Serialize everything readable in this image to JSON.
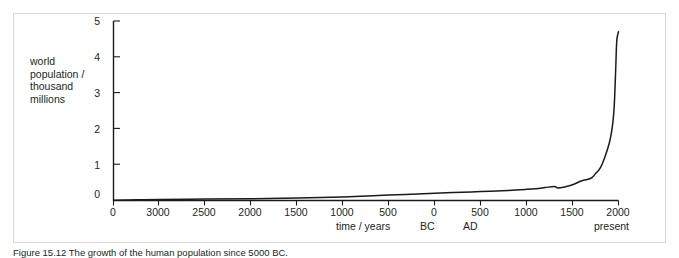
{
  "figure": {
    "caption": "Figure 15.12  The growth of the human population since 5000 BC.",
    "frame_color": "#d9d9d9",
    "line_color": "#1a1a1a",
    "background": "#ffffff"
  },
  "chart_data": {
    "type": "line",
    "title": "",
    "xlabel": "time / years",
    "ylabel": "world population / thousand millions",
    "ylabel_lines": [
      "world",
      "population /",
      "thousand",
      "millions"
    ],
    "grid": false,
    "legend": "none",
    "ylim": [
      0,
      5
    ],
    "ytick_labels": [
      "5",
      "4",
      "3",
      "2",
      "1",
      "0"
    ],
    "ytick_values": [
      5,
      4,
      3,
      2,
      1,
      0
    ],
    "xtick_labels": [
      "0",
      "3000",
      "2500",
      "2000",
      "1500",
      "1000",
      "500",
      "0",
      "500",
      "1000",
      "1500",
      "2000"
    ],
    "xtick_years": [
      -5000,
      -3000,
      -2500,
      -2000,
      -1500,
      -1000,
      -500,
      0,
      500,
      1000,
      1500,
      2000
    ],
    "era_annotations": [
      {
        "label": "time / years"
      },
      {
        "label": "BC"
      },
      {
        "label": "AD"
      },
      {
        "label": "present"
      }
    ],
    "series": [
      {
        "name": "world population",
        "units": "thousand millions",
        "x": [
          -5000,
          -4000,
          -3000,
          -2500,
          -2000,
          -1500,
          -1000,
          -500,
          0,
          200,
          500,
          800,
          1000,
          1100,
          1200,
          1300,
          1340,
          1400,
          1500,
          1600,
          1700,
          1750,
          1800,
          1850,
          1900,
          1930,
          1950,
          1960,
          1970,
          1980,
          1990,
          2000
        ],
        "values": [
          0.01,
          0.02,
          0.03,
          0.04,
          0.05,
          0.07,
          0.1,
          0.15,
          0.2,
          0.22,
          0.25,
          0.28,
          0.31,
          0.33,
          0.36,
          0.39,
          0.35,
          0.37,
          0.44,
          0.55,
          0.62,
          0.75,
          0.9,
          1.2,
          1.6,
          2.0,
          2.5,
          3.0,
          3.7,
          4.4,
          4.6,
          4.7
        ]
      }
    ],
    "annotations": [
      {
        "name": "plague-dip",
        "year": 1350,
        "note": "dip in curve"
      },
      {
        "name": "exponential-rise",
        "year": 1800,
        "note": "steep rise to present"
      }
    ]
  }
}
